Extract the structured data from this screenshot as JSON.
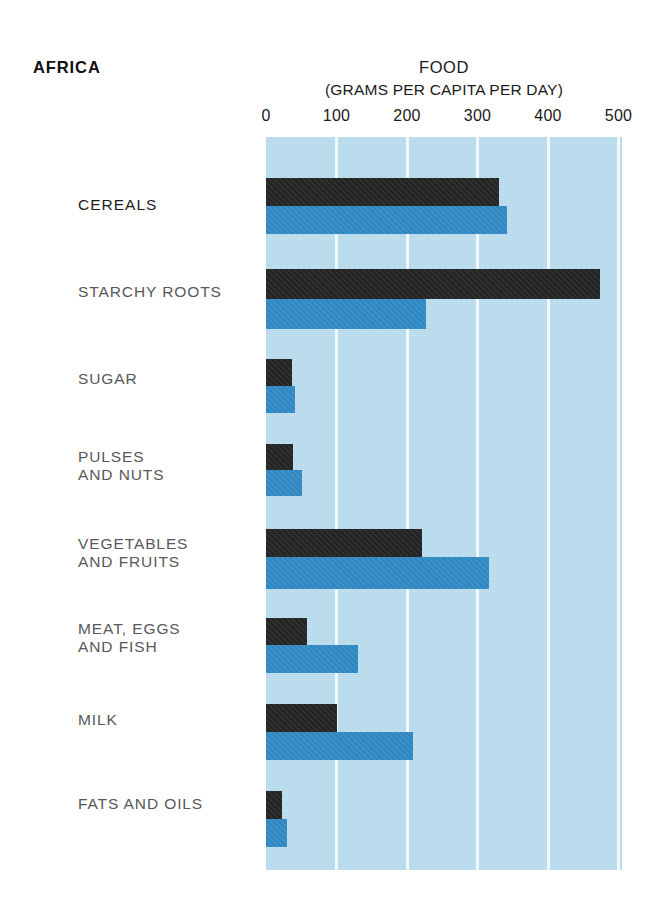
{
  "header": {
    "region": "AFRICA",
    "title": "FOOD",
    "subtitle": "(GRAMS PER CAPITA PER DAY)"
  },
  "axis": {
    "ticks": [
      "0",
      "100",
      "200",
      "300",
      "400",
      "500"
    ]
  },
  "colors": {
    "plot_background": "#b9dced",
    "gridline": "#f2fafd",
    "series_black": "#232323",
    "series_blue": "#2f87c2",
    "label_text": "#585858",
    "title_text": "#111111"
  },
  "categories": [
    {
      "label": "CEREALS"
    },
    {
      "label": "STARCHY ROOTS"
    },
    {
      "label": "SUGAR"
    },
    {
      "label": "PULSES\nAND NUTS"
    },
    {
      "label": "VEGETABLES\nAND FRUITS"
    },
    {
      "label": "MEAT, EGGS\nAND FISH"
    },
    {
      "label": "MILK"
    },
    {
      "label": "FATS AND OILS"
    }
  ],
  "chart_data": {
    "type": "bar",
    "orientation": "horizontal",
    "title": "FOOD",
    "subtitle": "(GRAMS PER CAPITA PER DAY)",
    "region": "AFRICA",
    "xlabel": "(GRAMS PER CAPITA PER DAY)",
    "ylabel": "",
    "xlim": [
      0,
      505
    ],
    "xticks": [
      0,
      100,
      200,
      300,
      400,
      500
    ],
    "grid": true,
    "legend": "none",
    "categories": [
      "CEREALS",
      "STARCHY ROOTS",
      "SUGAR",
      "PULSES AND NUTS",
      "VEGETABLES AND FRUITS",
      "MEAT, EGGS AND FISH",
      "MILK",
      "FATS AND OILS"
    ],
    "series": [
      {
        "name": "series-black",
        "color": "#232323",
        "values": [
          330,
          474,
          37,
          38,
          221,
          58,
          101,
          23
        ]
      },
      {
        "name": "series-blue",
        "color": "#2f87c2",
        "values": [
          342,
          227,
          41,
          51,
          316,
          131,
          209,
          30
        ]
      }
    ]
  },
  "layout": {
    "plot_left_px": 266,
    "plot_top_px": 137,
    "plot_width_px": 356,
    "plot_height_px": 733,
    "px_per_unit": 0.705,
    "rows": [
      {
        "black_top": 41,
        "black_h": 28,
        "blue_top": 69,
        "blue_h": 28
      },
      {
        "black_top": 132,
        "black_h": 30,
        "blue_top": 162,
        "blue_h": 30
      },
      {
        "black_top": 222,
        "black_h": 27,
        "blue_top": 249,
        "blue_h": 27
      },
      {
        "black_top": 307,
        "black_h": 26,
        "blue_top": 333,
        "blue_h": 26
      },
      {
        "black_top": 392,
        "black_h": 28,
        "blue_top": 420,
        "blue_h": 32
      },
      {
        "black_top": 481,
        "black_h": 27,
        "blue_top": 508,
        "blue_h": 28
      },
      {
        "black_top": 567,
        "black_h": 28,
        "blue_top": 595,
        "blue_h": 28
      },
      {
        "black_top": 654,
        "black_h": 28,
        "blue_top": 682,
        "blue_h": 28
      }
    ],
    "label_tops": [
      196,
      283,
      370,
      448,
      535,
      620,
      711,
      795
    ]
  }
}
